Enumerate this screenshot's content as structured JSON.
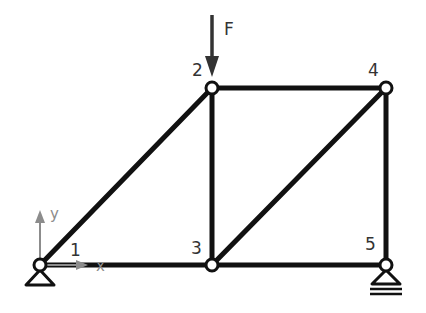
{
  "diagram": {
    "type": "truss",
    "colors": {
      "member": "#111111",
      "node_fill": "#ffffff",
      "label": "#333333",
      "axis": "#8c8c8c"
    },
    "nodes": [
      {
        "id": "1",
        "label": "1",
        "x": 40,
        "y": 265
      },
      {
        "id": "2",
        "label": "2",
        "x": 212,
        "y": 88
      },
      {
        "id": "3",
        "label": "3",
        "x": 212,
        "y": 265
      },
      {
        "id": "4",
        "label": "4",
        "x": 386,
        "y": 88
      },
      {
        "id": "5",
        "label": "5",
        "x": 386,
        "y": 265
      }
    ],
    "members": [
      [
        "1",
        "2"
      ],
      [
        "1",
        "3"
      ],
      [
        "2",
        "3"
      ],
      [
        "2",
        "4"
      ],
      [
        "3",
        "4"
      ],
      [
        "3",
        "5"
      ],
      [
        "4",
        "5"
      ]
    ],
    "supports": [
      {
        "node": "1",
        "type": "pin"
      },
      {
        "node": "5",
        "type": "roller"
      }
    ],
    "load": {
      "node": "2",
      "label": "F",
      "direction": "down"
    },
    "axes": {
      "x_label": "x",
      "y_label": "y"
    }
  }
}
